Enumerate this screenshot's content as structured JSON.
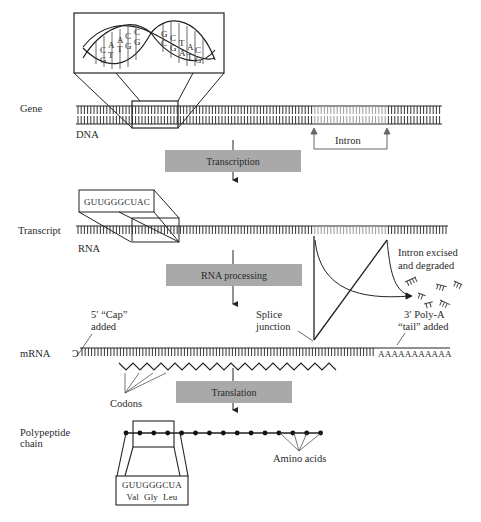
{
  "labels": {
    "gene": "Gene",
    "dna": "DNA",
    "intron": "Intron",
    "transcript": "Transcript",
    "rna": "RNA",
    "cap_line1": "5′ “Cap”",
    "cap_line2": "added",
    "mrna": "mRNA",
    "splice_line1": "Splice",
    "splice_line2": "junction",
    "excised_line1": "Intron excised",
    "excised_line2": "and degraded",
    "polya_line1": "3′ Poly-A",
    "polya_line2": "“tail” added",
    "polya_seq": "AAAAAAAAAAA",
    "codons": "Codons",
    "polypeptide_line1": "Polypeptide",
    "polypeptide_line2": "chain",
    "amino_acids": "Amino acids"
  },
  "process_boxes": {
    "transcription": "Transcription",
    "rna_processing": "RNA processing",
    "translation": "Translation"
  },
  "dna_helix": {
    "left_bases": [
      [
        "C",
        "G"
      ],
      [
        "A",
        "T"
      ],
      [
        "A",
        "T"
      ],
      [
        "C",
        "G"
      ],
      [
        "C",
        "G"
      ]
    ],
    "right_bases": [
      [
        "G",
        "C"
      ],
      [
        "C",
        "G"
      ],
      [
        "T",
        "A"
      ],
      [
        "A",
        "T"
      ],
      [
        "C",
        "G"
      ]
    ]
  },
  "transcript_box_seq": "GUUGGGCUAC",
  "codon_box": {
    "sequence": "GUUGGGCUA",
    "amino_acids": "Val  Gly  Leu"
  },
  "colors": {
    "process_box_fill": "#a9a9a9",
    "line": "#222222",
    "arrow_gray": "#555555"
  }
}
